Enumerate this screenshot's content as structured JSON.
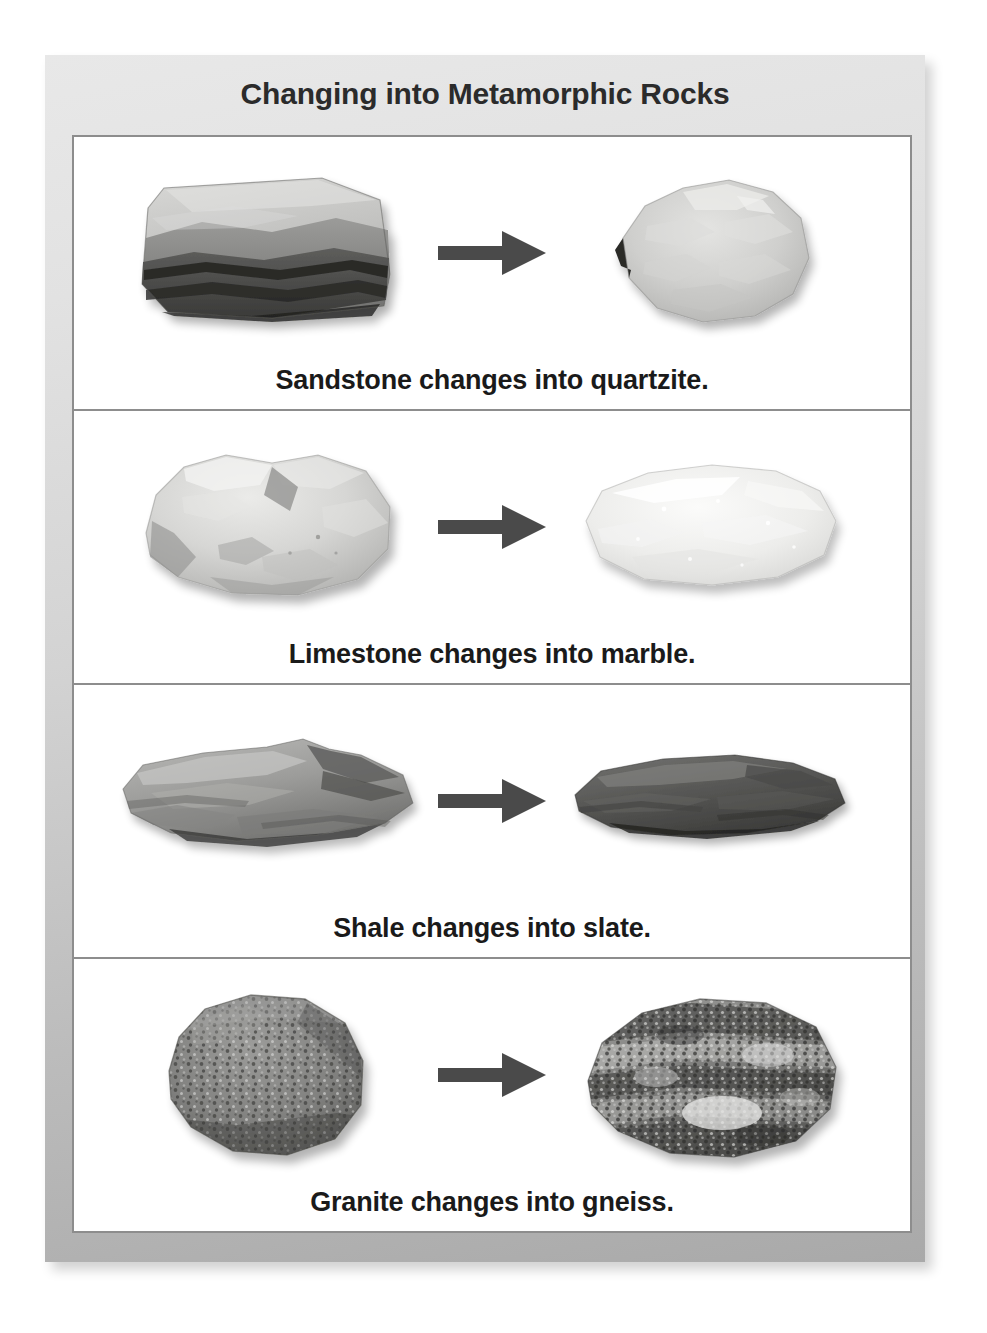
{
  "figure": {
    "title": "Changing into Metamorphic Rocks",
    "frame_color": "#c8c8c8",
    "table_border_color": "#8d8d8d",
    "background_color": "#ffffff",
    "arrow_color": "#4a4a4a",
    "caption_color": "#1a1a1a"
  },
  "rows": [
    {
      "caption": "Sandstone changes into quartzite.",
      "before": {
        "name": "sandstone",
        "label": "Sandstone",
        "type": "sedimentary",
        "appearance": "layered rectangular block, pale gray upper face with dark banded strata below"
      },
      "after": {
        "name": "quartzite",
        "label": "quartzite",
        "type": "metamorphic",
        "appearance": "irregular lumpy light gray rock with sugary crystalline surface"
      },
      "arrow": "right-arrow"
    },
    {
      "caption": "Limestone changes into marble.",
      "before": {
        "name": "limestone",
        "label": "Limestone",
        "type": "sedimentary",
        "appearance": "chunky pale gray rock with angular facets and shadowed crevices"
      },
      "after": {
        "name": "marble",
        "label": "marble",
        "type": "metamorphic",
        "appearance": "smooth very light gray rounded slab with faint sparkling grain"
      },
      "arrow": "right-arrow"
    },
    {
      "caption": "Shale changes into slate.",
      "before": {
        "name": "shale",
        "label": "Shale",
        "type": "sedimentary",
        "appearance": "flat wide medium gray slab with thin flaky layers"
      },
      "after": {
        "name": "slate",
        "label": "slate",
        "type": "metamorphic",
        "appearance": "flat dark gray elongated slab with smooth cleaved surface"
      },
      "arrow": "right-arrow"
    },
    {
      "caption": "Granite changes into gneiss.",
      "before": {
        "name": "granite",
        "label": "Granite",
        "type": "igneous",
        "appearance": "rounded dark gray boulder with fine speckled mineral texture"
      },
      "after": {
        "name": "gneiss",
        "label": "gneiss",
        "type": "metamorphic",
        "appearance": "banded rock with alternating light and dark coarse mineral stripes"
      },
      "arrow": "right-arrow"
    }
  ]
}
